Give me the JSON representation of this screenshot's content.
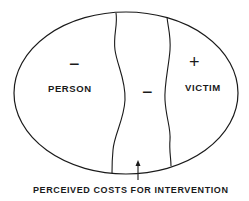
{
  "diagram": {
    "regions": {
      "left": {
        "label": "PERSON",
        "sign": "−"
      },
      "middle": {
        "sign": "−"
      },
      "right": {
        "label": "VICTIM",
        "sign": "+"
      }
    },
    "caption": "PERCEIVED COSTS FOR INTERVENTION",
    "colors": {
      "stroke": "#1a1a1a",
      "background": "#ffffff"
    }
  }
}
